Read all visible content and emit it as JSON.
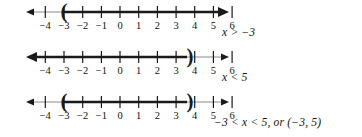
{
  "figure": {
    "background_color": "#ffffff",
    "ink_color": "#1a1a1a",
    "thin_color": "#8a8a8a",
    "tick_labels": [
      "−4",
      "−3",
      "−2",
      "−1",
      "0",
      "1",
      "2",
      "3",
      "4",
      "5",
      "6"
    ],
    "tick_values": [
      -4,
      -3,
      -2,
      -1,
      0,
      1,
      2,
      3,
      4,
      5,
      6
    ],
    "axis_min": -4.8,
    "axis_max": 6.8
  },
  "lines": [
    {
      "id": "line-greater-than-neg3",
      "label": "x > −3",
      "interval_type": "open-ray-right",
      "endpoint_open_left": -3,
      "endpoint_open_right": null,
      "bracket_left": "(",
      "bracket_right": "",
      "shaded_from": -3,
      "shaded_to": 6.8,
      "arrow_left": true,
      "arrow_right": true,
      "bold_arrow_side": "right"
    },
    {
      "id": "line-less-than-5",
      "label": "x < 5",
      "interval_type": "open-ray-left",
      "endpoint_open_left": null,
      "endpoint_open_right": 5,
      "bracket_left": "",
      "bracket_right": ")",
      "shaded_from": -4.8,
      "shaded_to": 5,
      "arrow_left": true,
      "arrow_right": true,
      "bold_arrow_side": "left"
    },
    {
      "id": "line-between-neg3-and-5",
      "label": "−3 < x < 5, or (−3, 5)",
      "interval_type": "open-interval",
      "endpoint_open_left": -3,
      "endpoint_open_right": 5,
      "bracket_left": "(",
      "bracket_right": ")",
      "shaded_from": -3,
      "shaded_to": 5,
      "arrow_left": true,
      "arrow_right": true,
      "bold_arrow_side": "none"
    }
  ]
}
